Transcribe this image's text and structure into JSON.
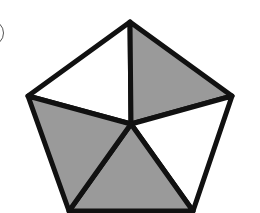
{
  "figure": {
    "label_fragment": "circled label partially visible at top-left (text cut off)",
    "colors": {
      "stroke": "#111111",
      "shade": "#9a9a9a",
      "unshaded": "#ffffff"
    },
    "vertices": {
      "top": [
        130,
        22
      ],
      "right": [
        232,
        96
      ],
      "bottom_right": [
        193,
        211
      ],
      "bottom_left": [
        69,
        211
      ],
      "left": [
        28,
        96
      ],
      "center": [
        131,
        124
      ]
    },
    "triangles": [
      {
        "name": "top-left",
        "shaded": false
      },
      {
        "name": "top-right",
        "shaded": true
      },
      {
        "name": "right",
        "shaded": false
      },
      {
        "name": "bottom",
        "shaded": true
      },
      {
        "name": "left",
        "shaded": true
      }
    ],
    "shaded_count": 3,
    "total_parts": 5
  }
}
